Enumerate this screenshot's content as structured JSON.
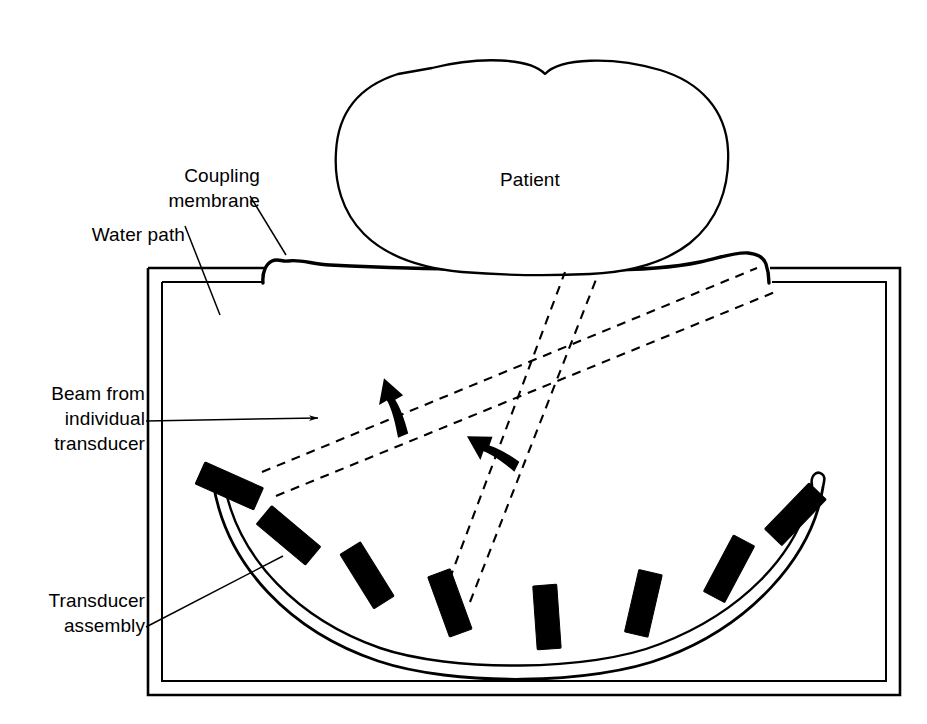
{
  "figure": {
    "background_color": "#ffffff",
    "ink_color": "#000000",
    "width": 927,
    "height": 724
  },
  "labels": {
    "coupling_membrane": "Coupling\nmembrane",
    "water_path": "Water path",
    "beam_from_individual_transducer": "Beam from\nindividual\ntransducer",
    "transducer_assembly": "Transducer\nassembly",
    "patient": "Patient"
  },
  "parts": {
    "tank": {
      "name": "Water tank",
      "wall_style": "double-line",
      "outer": {
        "x": 148,
        "y": 267,
        "width": 752,
        "height": 428
      },
      "inner": {
        "x": 161,
        "y": 281,
        "width": 726,
        "height": 400
      }
    },
    "membrane": {
      "name": "Coupling membrane",
      "left_anchor_x": 265,
      "right_anchor_x": 770,
      "anchor_y": 267,
      "stroke_width": 3.2
    },
    "patient_blob": {
      "name": "Patient cross-section",
      "center_x": 530,
      "center_y": 172,
      "notch_top_x": 545,
      "stroke_width": 2.2
    },
    "transducer_arc": {
      "name": "Curved transducer assembly rail",
      "left_end": {
        "x": 218,
        "y": 481
      },
      "right_end": {
        "x": 818,
        "y": 487
      },
      "bottom": {
        "x": 518,
        "y": 640
      },
      "style": "double-line rail with rounded end caps",
      "element_count": 8
    },
    "transducers": [
      {
        "index": 1,
        "stem_base_x": 243,
        "stem_base_y": 492,
        "angle_deg": -66
      },
      {
        "index": 2,
        "stem_base_x": 300,
        "stem_base_y": 545,
        "angle_deg": -50
      },
      {
        "index": 3,
        "stem_base_x": 375,
        "stem_base_y": 588,
        "angle_deg": -32
      },
      {
        "index": 4,
        "stem_base_x": 455,
        "stem_base_y": 617,
        "angle_deg": -20
      },
      {
        "index": 5,
        "stem_base_x": 548,
        "stem_base_y": 632,
        "angle_deg": -4
      },
      {
        "index": 6,
        "stem_base_x": 640,
        "stem_base_y": 618,
        "angle_deg": 13
      },
      {
        "index": 7,
        "stem_base_x": 722,
        "stem_base_y": 582,
        "angle_deg": 28
      },
      {
        "index": 8,
        "stem_base_x": 785,
        "stem_base_y": 525,
        "angle_deg": 44
      }
    ],
    "beams": [
      {
        "name": "beam-from-element-1",
        "origin": {
          "x": 265,
          "y": 480
        },
        "target_left": {
          "x": 757,
          "y": 268
        },
        "target_right": {
          "x": 773,
          "y": 290
        },
        "style": "dashed"
      },
      {
        "name": "beam-from-element-4",
        "origin": {
          "x": 452,
          "y": 592
        },
        "target_left": {
          "x": 566,
          "y": 272
        },
        "target_right": {
          "x": 596,
          "y": 276
        },
        "style": "dashed"
      }
    ],
    "sweep_arrows": [
      {
        "name": "sweep-arrow-upper-left",
        "x": 392,
        "y": 400,
        "rotation_deg": -20
      },
      {
        "name": "sweep-arrow-lower-right",
        "x": 487,
        "y": 447,
        "rotation_deg": -20
      }
    ]
  },
  "leaders": [
    {
      "name": "coupling-membrane-leader",
      "from": {
        "x": 250,
        "y": 196
      },
      "to": {
        "x": 285,
        "y": 254
      }
    },
    {
      "name": "water-path-leader",
      "from": {
        "x": 185,
        "y": 226
      },
      "to": {
        "x": 219,
        "y": 314
      }
    },
    {
      "name": "beam-leader",
      "from": {
        "x": 148,
        "y": 420
      },
      "to": {
        "x": 322,
        "y": 419
      },
      "arrowhead": true
    },
    {
      "name": "transducer-assembly-leader",
      "from": {
        "x": 148,
        "y": 626
      },
      "to": {
        "x": 282,
        "y": 556
      }
    }
  ]
}
